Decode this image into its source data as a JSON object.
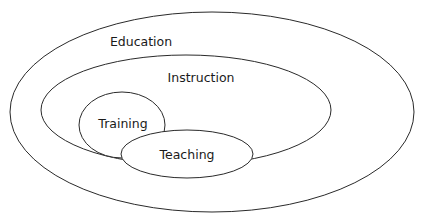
{
  "diagram": {
    "type": "nested-set-diagram",
    "sets": [
      {
        "id": "education",
        "label": "Education",
        "contains": [
          "instruction"
        ]
      },
      {
        "id": "instruction",
        "label": "Instruction",
        "contains": [
          "training",
          "teaching"
        ]
      },
      {
        "id": "training",
        "label": "Training",
        "contains": []
      },
      {
        "id": "teaching",
        "label": "Teaching",
        "contains": [],
        "overlaps": [
          "training"
        ]
      }
    ],
    "colors": {
      "stroke": "#2a2a2a",
      "fill": "#ffffff",
      "text": "#1a1a1a"
    }
  }
}
